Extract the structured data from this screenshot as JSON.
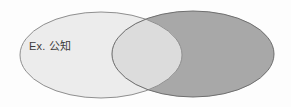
{
  "figure": {
    "name": "venn-diagram",
    "type": "venn",
    "background_color": "#fdfdfd",
    "width": 291,
    "height": 107
  },
  "sets": [
    {
      "id": "left",
      "label": "Ex. 公知",
      "fill_color": "#e8e8e8",
      "stroke_color": "#8f8f8f",
      "center_x": 101,
      "center_y": 55,
      "radius_x": 81,
      "radius_y": 43
    },
    {
      "id": "right",
      "label": "",
      "fill_color": "#a8a8a8",
      "stroke_color": "#6f6f6f",
      "center_x": 193,
      "center_y": 54,
      "radius_x": 81,
      "radius_y": 43
    }
  ],
  "overlap": {
    "fill_color": "#bcbcbc",
    "stroke_color": "#6f6f6f"
  }
}
